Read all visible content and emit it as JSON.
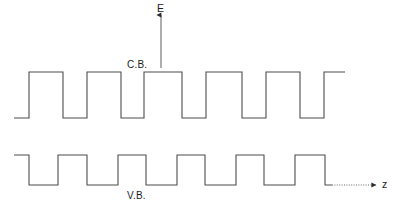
{
  "figure": {
    "kind": "superlattice-band-diagram",
    "background_color": "#ffffff",
    "stroke_color": "#4d4d4d",
    "text_color": "#1c1c1c",
    "width": 397,
    "height": 219
  },
  "labels": {
    "energy_axis": "E",
    "conduction_band": "C.B.",
    "valence_band": "V.B.",
    "z_axis": "z"
  },
  "chart_data": {
    "type": "line",
    "title": "",
    "xlabel": "z",
    "ylabel": "E",
    "grid": false,
    "legend": null,
    "annotations": [
      {
        "text": "E",
        "x": 161,
        "y": 8,
        "role": "axis-label"
      },
      {
        "text": "C.B.",
        "x": 140,
        "y": 65,
        "role": "band-label"
      },
      {
        "text": "V.B.",
        "x": 140,
        "y": 196,
        "role": "band-label"
      },
      {
        "text": "z",
        "x": 386,
        "y": 185,
        "role": "axis-label"
      }
    ],
    "axes": {
      "energy": {
        "label": "E",
        "orientation": "vertical",
        "arrow": "up",
        "x": 161,
        "y_top": 14,
        "y_bottom": 68,
        "style": "solid"
      },
      "position": {
        "label": "z",
        "orientation": "horizontal",
        "arrow": "right",
        "y": 185,
        "x_start": 332,
        "x_end": 376,
        "style": "dotted"
      }
    },
    "series": [
      {
        "name": "C.B.",
        "description": "Conduction band edge: periodic square barrier profile (superlattice). Barrier tops are high, quantum wells are low.",
        "periods": 6,
        "levels": {
          "well_bottom_y": 118,
          "barrier_top_y": 72
        },
        "x": [
          14,
          29,
          29,
          63,
          63,
          87,
          87,
          121,
          121,
          144,
          144,
          182,
          182,
          206,
          206,
          242,
          242,
          266,
          266,
          300,
          300,
          324,
          324,
          345
        ],
        "y": [
          118,
          118,
          72,
          72,
          118,
          118,
          72,
          72,
          118,
          118,
          72,
          72,
          118,
          118,
          72,
          72,
          118,
          118,
          72,
          72,
          118,
          118,
          72,
          72
        ]
      },
      {
        "name": "V.B.",
        "description": "Valence band edge: inverted periodic square profile, mirroring the conduction band wells.",
        "periods": 6,
        "levels": {
          "barrier_top_y": 155,
          "well_bottom_y": 185
        },
        "x": [
          14,
          29,
          29,
          58,
          58,
          87,
          87,
          118,
          118,
          146,
          146,
          177,
          177,
          205,
          205,
          236,
          236,
          264,
          264,
          295,
          295,
          325,
          325,
          332
        ],
        "y": [
          155,
          155,
          185,
          185,
          155,
          155,
          185,
          185,
          155,
          155,
          185,
          185,
          155,
          155,
          185,
          185,
          155,
          155,
          185,
          185,
          155,
          155,
          185,
          185
        ]
      }
    ]
  }
}
